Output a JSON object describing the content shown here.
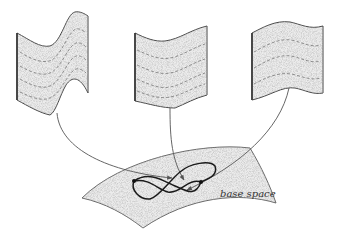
{
  "figure": {
    "type": "fiber-bundle-illustration",
    "base_label": "base space",
    "fibers": [
      {
        "name": "left-fiber",
        "dashed_lines": 4
      },
      {
        "name": "middle-fiber",
        "dashed_lines": 4
      },
      {
        "name": "right-fiber",
        "dashed_lines": 3
      }
    ],
    "colors": {
      "stroke": "#444444",
      "fill": "#e6e6e6",
      "curve": "#555555",
      "loop": "#1a1a1a"
    }
  }
}
